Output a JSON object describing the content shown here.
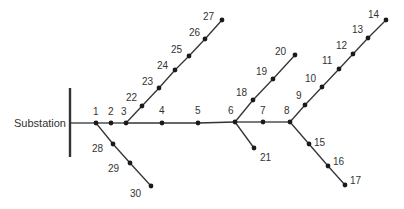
{
  "substation": {
    "label": "Substation",
    "bus": {
      "x": 70,
      "y1": 88,
      "y2": 157
    },
    "label_pos": {
      "x": 14,
      "y": 127
    }
  },
  "colors": {
    "line": "#333333",
    "node": "#1a1a1a",
    "text": "#333333"
  },
  "nodes": [
    {
      "id": "1",
      "x": 96,
      "y": 123,
      "lx": 93,
      "ly": 115
    },
    {
      "id": "2",
      "x": 111,
      "y": 123,
      "lx": 108,
      "ly": 115
    },
    {
      "id": "3",
      "x": 126,
      "y": 123,
      "lx": 121,
      "ly": 115
    },
    {
      "id": "4",
      "x": 162,
      "y": 123,
      "lx": 159,
      "ly": 114
    },
    {
      "id": "5",
      "x": 198,
      "y": 123,
      "lx": 195,
      "ly": 114
    },
    {
      "id": "6",
      "x": 235,
      "y": 122,
      "lx": 228,
      "ly": 114
    },
    {
      "id": "7",
      "x": 263,
      "y": 122,
      "lx": 260,
      "ly": 114
    },
    {
      "id": "8",
      "x": 290,
      "y": 122,
      "lx": 284,
      "ly": 114
    },
    {
      "id": "9",
      "x": 305,
      "y": 105,
      "lx": 296,
      "ly": 99
    },
    {
      "id": "10",
      "x": 322,
      "y": 87,
      "lx": 305,
      "ly": 82
    },
    {
      "id": "11",
      "x": 339,
      "y": 69,
      "lx": 322,
      "ly": 64
    },
    {
      "id": "12",
      "x": 353,
      "y": 54,
      "lx": 336,
      "ly": 49
    },
    {
      "id": "13",
      "x": 368,
      "y": 38,
      "lx": 352,
      "ly": 33
    },
    {
      "id": "14",
      "x": 386,
      "y": 20,
      "lx": 368,
      "ly": 18
    },
    {
      "id": "15",
      "x": 309,
      "y": 144,
      "lx": 314,
      "ly": 146
    },
    {
      "id": "16",
      "x": 328,
      "y": 166,
      "lx": 333,
      "ly": 165
    },
    {
      "id": "17",
      "x": 345,
      "y": 185,
      "lx": 350,
      "ly": 184
    },
    {
      "id": "18",
      "x": 253,
      "y": 100,
      "lx": 236,
      "ly": 96
    },
    {
      "id": "19",
      "x": 273,
      "y": 79,
      "lx": 256,
      "ly": 75
    },
    {
      "id": "20",
      "x": 295,
      "y": 55,
      "lx": 275,
      "ly": 55
    },
    {
      "id": "21",
      "x": 254,
      "y": 148,
      "lx": 260,
      "ly": 161
    },
    {
      "id": "22",
      "x": 142,
      "y": 106,
      "lx": 126,
      "ly": 101
    },
    {
      "id": "23",
      "x": 159,
      "y": 88,
      "lx": 142,
      "ly": 85
    },
    {
      "id": "24",
      "x": 175,
      "y": 70,
      "lx": 157,
      "ly": 69
    },
    {
      "id": "25",
      "x": 189,
      "y": 56,
      "lx": 171,
      "ly": 53
    },
    {
      "id": "26",
      "x": 205,
      "y": 39,
      "lx": 189,
      "ly": 36
    },
    {
      "id": "27",
      "x": 222,
      "y": 20,
      "lx": 203,
      "ly": 20
    },
    {
      "id": "28",
      "x": 113,
      "y": 144,
      "lx": 92,
      "ly": 152
    },
    {
      "id": "29",
      "x": 130,
      "y": 163,
      "lx": 108,
      "ly": 172
    },
    {
      "id": "30",
      "x": 151,
      "y": 186,
      "lx": 130,
      "ly": 197
    }
  ],
  "edges": [
    [
      "bus",
      "1"
    ],
    [
      "1",
      "2"
    ],
    [
      "2",
      "3"
    ],
    [
      "3",
      "4"
    ],
    [
      "4",
      "5"
    ],
    [
      "5",
      "6"
    ],
    [
      "6",
      "7"
    ],
    [
      "7",
      "8"
    ],
    [
      "8",
      "9"
    ],
    [
      "9",
      "10"
    ],
    [
      "10",
      "11"
    ],
    [
      "11",
      "12"
    ],
    [
      "12",
      "13"
    ],
    [
      "13",
      "14"
    ],
    [
      "8",
      "15"
    ],
    [
      "15",
      "16"
    ],
    [
      "16",
      "17"
    ],
    [
      "6",
      "18"
    ],
    [
      "18",
      "19"
    ],
    [
      "19",
      "20"
    ],
    [
      "6",
      "21"
    ],
    [
      "3",
      "22"
    ],
    [
      "22",
      "23"
    ],
    [
      "23",
      "24"
    ],
    [
      "24",
      "25"
    ],
    [
      "25",
      "26"
    ],
    [
      "26",
      "27"
    ],
    [
      "1",
      "28"
    ],
    [
      "28",
      "29"
    ],
    [
      "29",
      "30"
    ]
  ]
}
